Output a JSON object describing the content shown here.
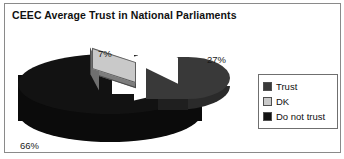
{
  "chart_data": {
    "type": "pie",
    "title": "CEEC Average Trust in National Parliaments",
    "subtitle": "",
    "xlabel": "",
    "ylabel": "",
    "categories": [
      "Trust",
      "DK",
      "Do not trust"
    ],
    "values": [
      27,
      7,
      66
    ],
    "value_labels": [
      "27%",
      "7%",
      "66%"
    ],
    "units": "percent",
    "exploded": true,
    "three_d": true,
    "grid": false,
    "legend_position": "right",
    "series": [
      {
        "name": "CEEC Average Trust in National Parliaments",
        "slices": [
          {
            "label": "Trust",
            "value": 27,
            "display": "27%",
            "color": "#393939"
          },
          {
            "label": "DK",
            "value": 7,
            "display": "7%",
            "color": "#c9c9c9"
          },
          {
            "label": "Do not trust",
            "value": 66,
            "display": "66%",
            "color": "#121212"
          }
        ]
      }
    ]
  },
  "title": "CEEC Average Trust in National Parliaments",
  "labels": {
    "trust_pct": "27%",
    "dk_pct": "7%",
    "donottrust_pct": "66%"
  },
  "legend": {
    "items": [
      {
        "label": "Trust",
        "color": "#393939"
      },
      {
        "label": "DK",
        "color": "#c9c9c9"
      },
      {
        "label": "Do not trust",
        "color": "#121212"
      }
    ]
  },
  "colors": {
    "trust": "#393939",
    "dk": "#c9c9c9",
    "do_not_trust": "#121212",
    "background": "#ffffff",
    "border": "#8a8a8a",
    "text": "#111111"
  }
}
